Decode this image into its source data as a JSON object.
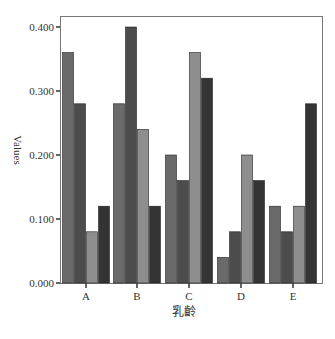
{
  "chart_data": {
    "type": "bar",
    "title": "",
    "xlabel": "乳齡",
    "ylabel": "Values",
    "categories": [
      "A",
      "B",
      "C",
      "D",
      "E"
    ],
    "series": [
      {
        "name": "series-1",
        "color": "#6a6a6a",
        "values": [
          0.36,
          0.28,
          0.2,
          0.04,
          0.12
        ]
      },
      {
        "name": "series-2",
        "color": "#4c4c4c",
        "values": [
          0.28,
          0.4,
          0.16,
          0.08,
          0.08
        ]
      },
      {
        "name": "series-3",
        "color": "#8e8e8e",
        "values": [
          0.08,
          0.24,
          0.36,
          0.2,
          0.12
        ]
      },
      {
        "name": "series-4",
        "color": "#343434",
        "values": [
          0.12,
          0.12,
          0.32,
          0.16,
          0.28
        ]
      }
    ],
    "ylim": [
      0,
      0.4
    ],
    "yticks": [
      "0.000",
      "0.100",
      "0.200",
      "0.300",
      "0.400"
    ],
    "grid": false,
    "legend": "none"
  }
}
